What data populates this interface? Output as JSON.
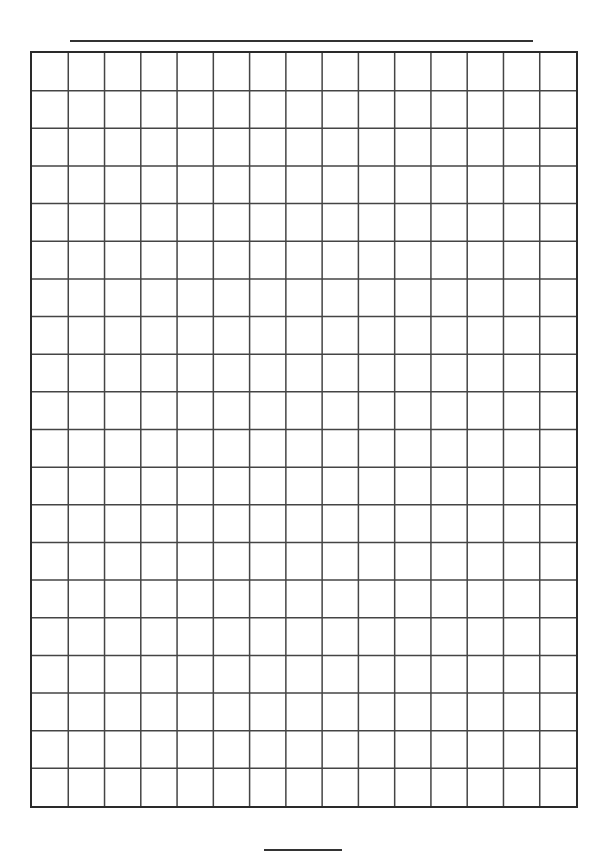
{
  "page": {
    "type": "graph-paper-worksheet",
    "background": "#ffffff"
  },
  "header": {
    "title_line": {
      "blank": true,
      "color": "#333333"
    }
  },
  "grid": {
    "columns": 15,
    "rows": 20,
    "border_color": "#2a2a2a",
    "line_color": "#444444"
  },
  "footer": {
    "page_number_line": {
      "blank": true,
      "color": "#333333"
    }
  }
}
